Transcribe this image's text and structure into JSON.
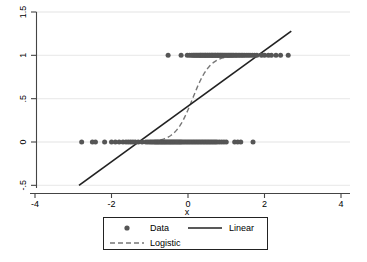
{
  "chart_data": {
    "type": "scatter",
    "title": "",
    "xlabel": "x",
    "ylabel": "",
    "xlim": [
      -4,
      4
    ],
    "ylim": [
      -0.5,
      1.5
    ],
    "grid": true,
    "grid_axis": "y",
    "x_ticks": [
      "-4",
      "-2",
      "0",
      "2",
      "4"
    ],
    "x_tick_values": [
      -4,
      -2,
      0,
      2,
      4
    ],
    "y_ticks": [
      "-.5",
      "0",
      ".5",
      "1",
      "1.5"
    ],
    "y_tick_values": [
      -0.5,
      0,
      0.5,
      1,
      1.5
    ],
    "legend_position": "bottom",
    "legend_entries": [
      {
        "label": "Data",
        "marker": "circle",
        "color": "#555555"
      },
      {
        "label": "Linear",
        "marker": "solid-line",
        "color": "#222222"
      },
      {
        "label": "Logistic",
        "marker": "dashed-line",
        "color": "#777777"
      }
    ],
    "series": [
      {
        "name": "Data",
        "type": "scatter",
        "marker": "circle",
        "color": "#555555",
        "points_y1_x": [
          -0.52,
          -0.18,
          -0.02,
          0.04,
          0.09,
          0.13,
          0.16,
          0.19,
          0.22,
          0.25,
          0.28,
          0.31,
          0.33,
          0.35,
          0.38,
          0.4,
          0.43,
          0.45,
          0.47,
          0.5,
          0.52,
          0.55,
          0.57,
          0.6,
          0.62,
          0.64,
          0.66,
          0.69,
          0.71,
          0.73,
          0.76,
          0.78,
          0.8,
          0.83,
          0.85,
          0.88,
          0.9,
          0.93,
          0.96,
          0.99,
          1.02,
          1.05,
          1.08,
          1.11,
          1.14,
          1.17,
          1.2,
          1.24,
          1.27,
          1.31,
          1.35,
          1.39,
          1.43,
          1.47,
          1.52,
          1.57,
          1.62,
          1.68,
          1.74,
          1.8,
          1.92,
          2.0,
          2.1,
          2.18,
          2.3,
          2.42,
          2.62
        ],
        "points_y0_x": [
          -2.78,
          -2.5,
          -2.42,
          -2.18,
          -2.0,
          -1.9,
          -1.8,
          -1.7,
          -1.62,
          -1.56,
          -1.5,
          -1.44,
          -1.38,
          -1.3,
          -1.2,
          -1.1,
          -1.05,
          -1.0,
          -0.96,
          -0.92,
          -0.88,
          -0.85,
          -0.82,
          -0.79,
          -0.76,
          -0.73,
          -0.7,
          -0.67,
          -0.64,
          -0.61,
          -0.58,
          -0.55,
          -0.52,
          -0.49,
          -0.46,
          -0.43,
          -0.4,
          -0.37,
          -0.34,
          -0.31,
          -0.28,
          -0.25,
          -0.22,
          -0.19,
          -0.16,
          -0.12,
          -0.08,
          -0.04,
          0.0,
          0.04,
          0.08,
          0.12,
          0.16,
          0.2,
          0.24,
          0.28,
          0.32,
          0.36,
          0.4,
          0.44,
          0.48,
          0.52,
          0.56,
          0.6,
          0.64,
          0.68,
          0.72,
          0.76,
          0.82,
          0.88,
          0.94,
          1.0,
          1.22,
          1.3,
          1.38,
          1.7
        ]
      },
      {
        "name": "Linear",
        "type": "line",
        "style": "solid",
        "color": "#222222",
        "x_start": -2.85,
        "y_start": -0.5,
        "x_end": 2.7,
        "y_end": 1.28,
        "slope": 0.3207,
        "intercept": 0.4139
      },
      {
        "name": "Logistic",
        "type": "line",
        "style": "dashed",
        "color": "#777777",
        "midpoint_x": 0.12,
        "steepness": 4.4,
        "x_range": [
          -1.35,
          1.85
        ],
        "y_range": [
          0.0,
          1.0
        ]
      }
    ]
  },
  "axis": {
    "x_title": "x"
  }
}
